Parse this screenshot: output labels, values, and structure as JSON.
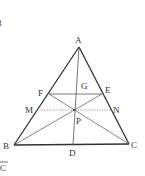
{
  "diagram": {
    "type": "geometry-triangle",
    "colors": {
      "stroke": "#333333",
      "thin": "#555555",
      "dotted": "#777777",
      "text": "#333333"
    },
    "points": {
      "A": {
        "label": "A",
        "x": 79,
        "y": 47
      },
      "B": {
        "label": "B",
        "x": 14,
        "y": 145
      },
      "C": {
        "label": "C",
        "x": 129,
        "y": 144
      },
      "D": {
        "label": "D",
        "x": 73,
        "y": 145
      },
      "E": {
        "label": "E",
        "x": 102,
        "y": 94
      },
      "F": {
        "label": "F",
        "x": 49,
        "y": 94
      },
      "G": {
        "label": "G",
        "x": 76,
        "y": 94
      },
      "M": {
        "label": "M",
        "x": 37,
        "y": 110
      },
      "N": {
        "label": "N",
        "x": 111,
        "y": 110
      },
      "P": {
        "label": "P",
        "x": 74,
        "y": 110
      }
    },
    "segments": [
      {
        "from": "A",
        "to": "B",
        "style": "thick"
      },
      {
        "from": "A",
        "to": "C",
        "style": "thick"
      },
      {
        "from": "B",
        "to": "C",
        "style": "thick"
      },
      {
        "from": "A",
        "to": "D",
        "style": "thin"
      },
      {
        "from": "F",
        "to": "E",
        "style": "thin"
      },
      {
        "from": "B",
        "to": "E",
        "style": "thin"
      },
      {
        "from": "C",
        "to": "F",
        "style": "thin"
      },
      {
        "from": "M",
        "to": "N",
        "style": "dotted"
      }
    ],
    "partial_text": {
      "top_left": "3",
      "bottom_left": "C"
    }
  }
}
